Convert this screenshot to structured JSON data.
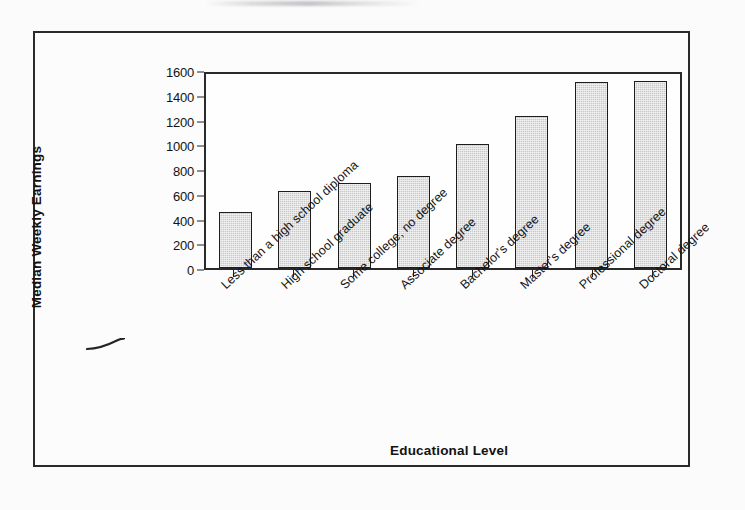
{
  "figure": {
    "artifacts": {
      "top_smudge": "illegible-scanned-text-fragment",
      "pen_mark": "hand-drawn-curved-stroke"
    }
  },
  "chart_data": {
    "type": "bar",
    "title": "",
    "subtitle": "",
    "xlabel": "Educational Level",
    "ylabel": "Median Weekly Earnings",
    "categories": [
      "Less than a high school diploma",
      "High school graduate",
      "Some college, no degree",
      "Associate degree",
      "Bachelor's degree",
      "Master's degree",
      "Professional degree",
      "Doctoral degree"
    ],
    "values": [
      450,
      620,
      690,
      740,
      1000,
      1230,
      1500,
      1510
    ],
    "ylim": [
      0,
      1600
    ],
    "ytick_labels": [
      "0",
      "200",
      "400",
      "600",
      "800",
      "1000",
      "1200",
      "1400",
      "1600"
    ],
    "ytick_values": [
      0,
      200,
      400,
      600,
      800,
      1000,
      1200,
      1400,
      1600
    ],
    "grid": false,
    "legend": null,
    "legend_position": "none",
    "bar_fill_color": "#c9c9c9",
    "bar_border_color": "#1d1d1d",
    "axis_color": "#2a2a2a",
    "plot_background": "#fefefe",
    "xtick_label_rotation": -43
  }
}
